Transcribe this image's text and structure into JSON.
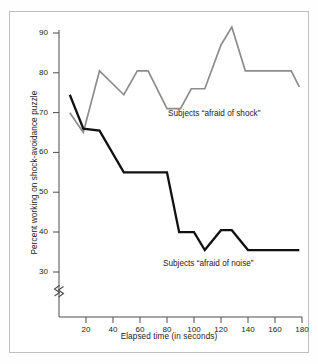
{
  "chart_data": {
    "type": "line",
    "title": "",
    "xlabel": "Elapsed time (in seconds)",
    "ylabel": "Percent working on shock-avoidance puzzle",
    "xlim": [
      0,
      180
    ],
    "ylim": [
      26,
      92
    ],
    "grid": false,
    "axis_break": "y-axis break below 30",
    "xticks": [
      20,
      40,
      60,
      80,
      100,
      120,
      140,
      160,
      180
    ],
    "yticks": [
      30,
      40,
      50,
      60,
      70,
      80,
      90
    ],
    "legend_position": "inline annotations next to each line",
    "series": [
      {
        "name": "Subjects “afraid of shock”",
        "color": "#8c8c8c",
        "x": [
          8,
          18,
          30,
          48,
          58,
          66,
          80,
          90,
          98,
          108,
          120,
          128,
          138,
          172,
          178
        ],
        "values": [
          70.0,
          65.0,
          80.5,
          74.5,
          80.5,
          80.5,
          71.0,
          71.0,
          76.0,
          76.0,
          87.0,
          91.5,
          80.5,
          80.5,
          76.5
        ]
      },
      {
        "name": "Subjects “afraid of noise”",
        "color": "#111111",
        "x": [
          8,
          18,
          30,
          48,
          80,
          89,
          100,
          108,
          120,
          128,
          140,
          178
        ],
        "values": [
          74.5,
          66.0,
          65.5,
          55.0,
          55.0,
          40.0,
          40.0,
          35.5,
          40.5,
          40.5,
          35.5,
          35.5
        ]
      }
    ],
    "annotations": [
      {
        "text": "Subjects “afraid of shock”",
        "x": 100,
        "y": 69
      },
      {
        "text": "Subjects “afraid of noise”",
        "x": 96,
        "y": 31.5
      }
    ]
  },
  "axis": {
    "y_tick_labels": [
      "90",
      "80",
      "70",
      "60",
      "50",
      "40",
      "30"
    ],
    "x_tick_labels": [
      "20",
      "40",
      "60",
      "80",
      "100",
      "120",
      "140",
      "160",
      "180"
    ],
    "y_title": "Percent working on shock-avoidance puzzle",
    "x_title": "Elapsed time (in seconds)"
  }
}
